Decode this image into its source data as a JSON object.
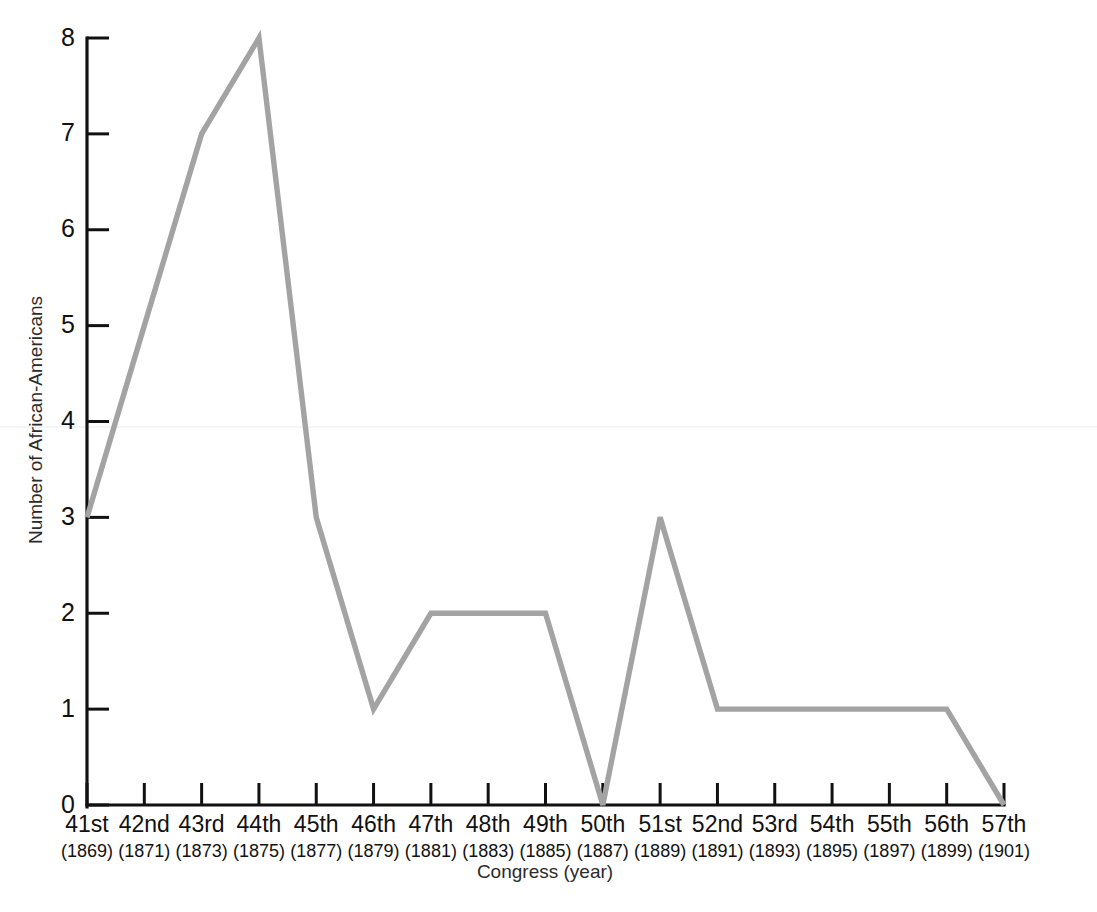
{
  "chart_data": {
    "type": "line",
    "title": "",
    "xlabel": "Congress (year)",
    "ylabel": "Number of African-Americans",
    "categories": [
      "41st",
      "42nd",
      "43rd",
      "44th",
      "45th",
      "46th",
      "47th",
      "48th",
      "49th",
      "50th",
      "51st",
      "52nd",
      "53rd",
      "54th",
      "55th",
      "56th",
      "57th"
    ],
    "category_years": [
      "(1869)",
      "(1871)",
      "(1873)",
      "(1875)",
      "(1877)",
      "(1879)",
      "(1881)",
      "(1883)",
      "(1885)",
      "(1887)",
      "(1889)",
      "(1891)",
      "(1893)",
      "(1895)",
      "(1897)",
      "(1899)",
      "(1901)"
    ],
    "values": [
      3,
      5,
      7,
      8,
      3,
      1,
      2,
      2,
      2,
      0,
      3,
      1,
      1,
      1,
      1,
      1,
      0
    ],
    "series": [
      {
        "name": "Number of African-Americans",
        "values": [
          3,
          5,
          7,
          8,
          3,
          1,
          2,
          2,
          2,
          0,
          3,
          1,
          1,
          1,
          1,
          1,
          0
        ]
      }
    ],
    "ylim": [
      0,
      8
    ],
    "ytick_labels": [
      "0",
      "1",
      "2",
      "3",
      "4",
      "5",
      "6",
      "7",
      "8"
    ],
    "yticks": [
      0,
      1,
      2,
      3,
      4,
      5,
      6,
      7,
      8
    ],
    "grid": false,
    "legend": false,
    "legend_position": "none",
    "line_color": "#a3a3a3",
    "axis_color": "#111111",
    "background_color": "#ffffff"
  }
}
